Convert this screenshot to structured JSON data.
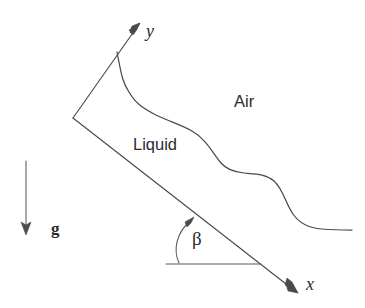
{
  "figure": {
    "kind": "physics-schematic",
    "background_color": "#ffffff",
    "line_color": "#4a4a4a",
    "text_color": "#2b2b2b",
    "width": 365,
    "height": 308
  },
  "axes": {
    "y_axis": {
      "label": "y",
      "origin": [
        73,
        118
      ],
      "tip": [
        140,
        23
      ],
      "style": "serif-italic"
    },
    "x_axis": {
      "label": "x",
      "origin": [
        73,
        118
      ],
      "tip": [
        298,
        293
      ],
      "label_pos": [
        306,
        290
      ],
      "style": "serif-italic"
    }
  },
  "angle": {
    "symbol": "β",
    "label_pos": [
      192,
      245
    ],
    "reference_line": {
      "from": [
        166,
        264
      ],
      "to": [
        261,
        264
      ]
    },
    "arc": {
      "start": [
        179,
        262
      ],
      "end": [
        194,
        218
      ]
    }
  },
  "gravity": {
    "label": "g",
    "label_pos": [
      51,
      234
    ],
    "arrow_from": [
      26,
      161
    ],
    "arrow_to": [
      26,
      234
    ],
    "style": "serif-bold"
  },
  "regions": [
    {
      "name": "air",
      "label": "Air",
      "label_pos": [
        234,
        107
      ],
      "style": "sans"
    },
    {
      "name": "liquid",
      "label": "Liquid",
      "label_pos": [
        133,
        150
      ],
      "style": "sans"
    }
  ],
  "interface": {
    "name": "liquid-air-free-surface",
    "description": "Wavy free surface of the liquid film, descending in two steps toward the downstream right edge",
    "start": [
      117,
      52
    ],
    "end": [
      352,
      230
    ],
    "waypoints": [
      [
        117,
        52
      ],
      [
        128,
        88
      ],
      [
        150,
        112
      ],
      [
        186,
        127
      ],
      [
        214,
        148
      ],
      [
        228,
        170
      ],
      [
        252,
        173
      ],
      [
        272,
        178
      ],
      [
        288,
        200
      ],
      [
        300,
        222
      ],
      [
        322,
        229
      ],
      [
        352,
        230
      ]
    ]
  },
  "film_base": {
    "name": "inclined-wall",
    "description": "Inclined solid wall along the x direction",
    "from": [
      73,
      118
    ],
    "to": [
      298,
      293
    ]
  }
}
